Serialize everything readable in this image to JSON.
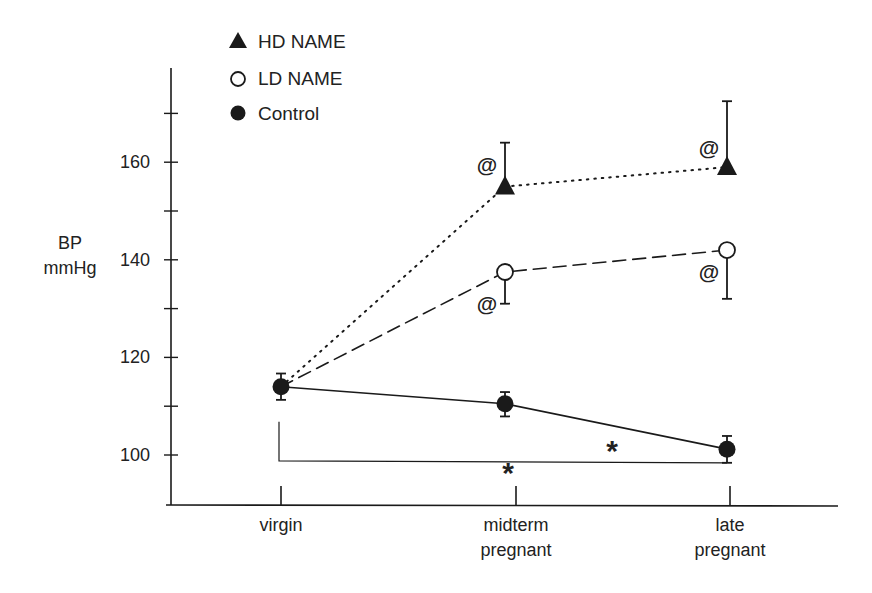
{
  "chart_data": {
    "type": "line",
    "title": "",
    "xlabel": "",
    "ylabel": "BP mmHg",
    "ylabel_lines": [
      "BP",
      "mmHg"
    ],
    "ylim": [
      90,
      178
    ],
    "yticks": [
      100,
      110,
      120,
      130,
      140,
      150,
      160,
      170
    ],
    "ytick_labels": [
      {
        "value": 100,
        "label": "100"
      },
      {
        "value": 120,
        "label": "120"
      },
      {
        "value": 140,
        "label": "140"
      },
      {
        "value": 160,
        "label": "160"
      }
    ],
    "grid": false,
    "legend_position": "upper-left",
    "categories": [
      "virgin",
      "midterm pregnant",
      "late pregnant"
    ],
    "category_labels": [
      [
        "virgin"
      ],
      [
        "midterm",
        "pregnant"
      ],
      [
        "late",
        "pregnant"
      ]
    ],
    "series": [
      {
        "name": "HD NAME",
        "marker": "filled-triangle",
        "line_style": "dotted",
        "values": [
          114,
          155,
          159
        ],
        "error_plus": [
          0,
          9,
          13.5
        ],
        "error_minus": [
          0,
          0,
          0
        ]
      },
      {
        "name": "LD NAME",
        "marker": "open-circle",
        "line_style": "dashed",
        "values": [
          114,
          137.5,
          142
        ],
        "error_plus": [
          0,
          0,
          0
        ],
        "error_minus": [
          0,
          6.5,
          10
        ]
      },
      {
        "name": "Control",
        "marker": "filled-circle",
        "line_style": "solid",
        "values": [
          114,
          110.5,
          101.2
        ],
        "error_plus": [
          2.7,
          2.4,
          2.7
        ],
        "error_minus": [
          2.7,
          2.6,
          2.8
        ]
      }
    ],
    "annotations": [
      {
        "text": "@",
        "meaning": "significance vs control",
        "series": "HD NAME",
        "category": "midterm pregnant",
        "y": 159.5
      },
      {
        "text": "@",
        "meaning": "significance vs control",
        "series": "HD NAME",
        "category": "late pregnant",
        "y": 163
      },
      {
        "text": "@",
        "meaning": "significance vs control",
        "series": "LD NAME",
        "category": "midterm pregnant",
        "y": 131
      },
      {
        "text": "@",
        "meaning": "significance vs control",
        "series": "LD NAME",
        "category": "late pregnant",
        "y": 137.5
      },
      {
        "text": "*",
        "meaning": "control midterm vs late",
        "x_px": 612,
        "y": 102.5
      },
      {
        "text": "*",
        "meaning": "control virgin vs late (bracket)",
        "x_px": 508,
        "y": 98
      }
    ],
    "bracket": {
      "from": "virgin",
      "to": "late pregnant",
      "y": 98.8,
      "top": 106.8
    }
  },
  "legend": {
    "items": [
      {
        "label": "HD NAME",
        "marker": "filled-triangle"
      },
      {
        "label": "LD NAME",
        "marker": "open-circle"
      },
      {
        "label": "Control",
        "marker": "filled-circle"
      }
    ]
  },
  "axis": {
    "y_title_line1": "BP",
    "y_title_line2": "mmHg"
  },
  "colors": {
    "ink": "#1a1a1a",
    "background": "#ffffff"
  }
}
